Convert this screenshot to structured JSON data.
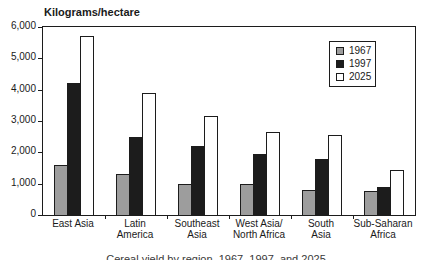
{
  "chart_data": {
    "type": "bar",
    "title": "Kilograms/hectare",
    "ylabel": "Kilograms/hectare",
    "xlabel": "",
    "ylim": [
      0,
      6000
    ],
    "ytick_interval": 1000,
    "ytick_labels": [
      "0",
      "1,000",
      "2,000",
      "3,000",
      "4,000",
      "5,000",
      "6,000"
    ],
    "grid": false,
    "legend_position": "upper-right-inside",
    "categories": [
      "East Asia",
      "Latin America",
      "Southeast Asia",
      "West Asia/North Africa",
      "South Asia",
      "Sub-Saharan Africa"
    ],
    "category_label_lines": [
      [
        "East Asia"
      ],
      [
        "Latin",
        "America"
      ],
      [
        "Southeast",
        "Asia"
      ],
      [
        "West Asia/",
        "North Africa"
      ],
      [
        "South",
        "Asia"
      ],
      [
        "Sub-Saharan",
        "Africa"
      ]
    ],
    "series": [
      {
        "name": "1967",
        "color": "#9d9d9d",
        "values": [
          1600,
          1300,
          1000,
          1000,
          800,
          750
        ]
      },
      {
        "name": "1997",
        "color": "#1c1c1c",
        "values": [
          4200,
          2500,
          2200,
          1950,
          1800,
          900
        ]
      },
      {
        "name": "2025",
        "color": "#ffffff",
        "values": [
          5700,
          3900,
          3150,
          2650,
          2550,
          1450
        ]
      }
    ]
  },
  "caption": {
    "text": "Cereal yield by region, 1967, 1997, and 2025"
  },
  "colors": {
    "axis": "#1c1c1c",
    "bar_gray": "#9d9d9d",
    "bar_black": "#1c1c1c",
    "bar_white": "#ffffff"
  }
}
